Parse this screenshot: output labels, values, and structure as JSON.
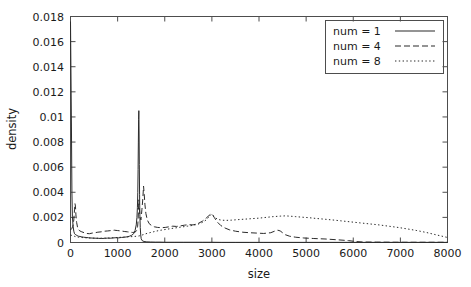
{
  "chart_data": {
    "type": "line",
    "title": "",
    "xlabel": "size",
    "ylabel": "density",
    "xlim": [
      0,
      8000
    ],
    "ylim": [
      0,
      0.018
    ],
    "grid": false,
    "legend_position": "top-right",
    "xticks": [
      0,
      1000,
      2000,
      3000,
      4000,
      5000,
      6000,
      7000,
      8000
    ],
    "xtick_labels": [
      "0",
      "1000",
      "2000",
      "3000",
      "4000",
      "5000",
      "6000",
      "7000",
      "8000"
    ],
    "yticks": [
      0,
      0.002,
      0.004,
      0.006,
      0.008,
      0.01,
      0.012,
      0.014,
      0.016,
      0.018
    ],
    "ytick_labels": [
      "0",
      "0.002",
      "0.004",
      "0.006",
      "0.008",
      "0.01",
      "0.012",
      "0.014",
      "0.016",
      "0.018"
    ],
    "series": [
      {
        "name": "num = 1",
        "label": "num = 1",
        "style": "solid",
        "color": "#2b2b2b",
        "x": [
          0,
          20,
          30,
          40,
          55,
          70,
          85,
          100,
          120,
          140,
          170,
          200,
          240,
          280,
          330,
          380,
          430,
          480,
          540,
          600,
          660,
          720,
          780,
          840,
          900,
          960,
          1020,
          1080,
          1140,
          1200,
          1250,
          1300,
          1340,
          1370,
          1395,
          1410,
          1420,
          1428,
          1434,
          1440,
          1445,
          1450,
          1455,
          1460,
          1466,
          1472,
          1480,
          1490,
          1500,
          1520,
          1560,
          1620,
          1700,
          1800,
          1900,
          2000,
          2200,
          2400,
          2600,
          2800,
          3000,
          3200,
          3500,
          3800,
          4100,
          4400,
          4700,
          5000,
          5500,
          6000,
          6500,
          7000,
          7500,
          8000
        ],
        "y": [
          0.0176,
          0.0092,
          0.004,
          0.0021,
          0.0013,
          0.0009,
          0.0007,
          0.00065,
          0.0006,
          0.00055,
          0.0005,
          0.00048,
          0.00045,
          0.00042,
          0.0004,
          0.00038,
          0.00036,
          0.00035,
          0.00034,
          0.00033,
          0.00032,
          0.00033,
          0.00035,
          0.00034,
          0.00036,
          0.00038,
          0.00037,
          0.0004,
          0.00042,
          0.00045,
          0.0005,
          0.00058,
          0.0007,
          0.00095,
          0.0014,
          0.002,
          0.0028,
          0.004,
          0.0058,
          0.008,
          0.0098,
          0.0105,
          0.0088,
          0.0062,
          0.0038,
          0.0022,
          0.0012,
          0.0006,
          0.0003,
          0.00015,
          8e-05,
          5e-05,
          4e-05,
          3e-05,
          3e-05,
          2e-05,
          2e-05,
          2e-05,
          2e-05,
          2e-05,
          2e-05,
          1e-05,
          1e-05,
          1e-05,
          1e-05,
          1e-05,
          1e-05,
          1e-05,
          1e-05,
          1e-05,
          1e-05,
          1e-05,
          1e-05,
          1e-05
        ],
        "peaks": [
          {
            "x": 0,
            "y": 0.0176
          },
          {
            "x": 1450,
            "y": 0.0105
          }
        ]
      },
      {
        "name": "num = 4",
        "label": "num = 4",
        "style": "dashed",
        "color": "#2b2b2b",
        "x": [
          0,
          25,
          50,
          70,
          85,
          95,
          105,
          115,
          130,
          150,
          175,
          200,
          240,
          290,
          340,
          400,
          460,
          520,
          580,
          650,
          720,
          790,
          860,
          930,
          1000,
          1070,
          1140,
          1210,
          1270,
          1320,
          1360,
          1390,
          1410,
          1425,
          1435,
          1442,
          1450,
          1460,
          1475,
          1495,
          1515,
          1535,
          1550,
          1565,
          1580,
          1600,
          1630,
          1670,
          1720,
          1780,
          1850,
          1930,
          2010,
          2090,
          2170,
          2250,
          2330,
          2420,
          2510,
          2600,
          2700,
          2800,
          2880,
          2940,
          2980,
          3010,
          3050,
          3110,
          3190,
          3280,
          3380,
          3500,
          3650,
          3800,
          3950,
          4100,
          4250,
          4330,
          4400,
          4450,
          4500,
          4560,
          4650,
          4780,
          4950,
          5150,
          5400,
          5650,
          5900,
          6050,
          6200,
          6500,
          7000,
          7500,
          8000
        ],
        "y": [
          0.001,
          0.0011,
          0.0013,
          0.0018,
          0.0026,
          0.0031,
          0.0029,
          0.0022,
          0.0016,
          0.0012,
          0.001,
          0.00092,
          0.00085,
          0.00078,
          0.00072,
          0.0007,
          0.00075,
          0.00078,
          0.00082,
          0.00085,
          0.0009,
          0.00092,
          0.00095,
          0.00098,
          0.00095,
          0.00092,
          0.00088,
          0.00085,
          0.00082,
          0.0008,
          0.00082,
          0.00088,
          0.001,
          0.0013,
          0.0018,
          0.0025,
          0.0034,
          0.0028,
          0.002,
          0.0018,
          0.0026,
          0.0035,
          0.0045,
          0.0038,
          0.003,
          0.0023,
          0.0018,
          0.0015,
          0.00135,
          0.00125,
          0.0012,
          0.00118,
          0.0012,
          0.00125,
          0.0013,
          0.00128,
          0.00132,
          0.00138,
          0.00142,
          0.0014,
          0.0015,
          0.0017,
          0.00195,
          0.00215,
          0.00228,
          0.00225,
          0.002,
          0.00165,
          0.00135,
          0.00115,
          0.001,
          0.0009,
          0.00082,
          0.00078,
          0.00075,
          0.00072,
          0.00078,
          0.0009,
          0.00098,
          0.00092,
          0.00078,
          0.00062,
          0.0005,
          0.00042,
          0.00036,
          0.00032,
          0.00028,
          0.00022,
          0.00015,
          8e-05,
          4e-05,
          3e-05,
          2e-05,
          2e-05,
          2e-05
        ],
        "peaks": [
          {
            "x": 100,
            "y": 0.0031
          },
          {
            "x": 1550,
            "y": 0.0045
          },
          {
            "x": 2980,
            "y": 0.0023
          },
          {
            "x": 4400,
            "y": 0.001
          }
        ]
      },
      {
        "name": "num = 8",
        "label": "num = 8",
        "style": "dotted",
        "color": "#2b2b2b",
        "x": [
          0,
          40,
          80,
          120,
          170,
          230,
          300,
          380,
          460,
          550,
          640,
          730,
          820,
          910,
          1000,
          1090,
          1180,
          1270,
          1350,
          1410,
          1450,
          1490,
          1540,
          1600,
          1680,
          1770,
          1860,
          1950,
          2050,
          2150,
          2260,
          2370,
          2480,
          2590,
          2700,
          2800,
          2880,
          2940,
          2990,
          3050,
          3120,
          3200,
          3300,
          3420,
          3550,
          3700,
          3850,
          4000,
          4150,
          4300,
          4450,
          4550,
          4650,
          4780,
          4900,
          5050,
          5200,
          5380,
          5550,
          5750,
          5950,
          6150,
          6350,
          6550,
          6750,
          6950,
          7150,
          7350,
          7550,
          7750,
          8000
        ],
        "y": [
          0.0006,
          0.00055,
          0.0005,
          0.00045,
          0.00042,
          0.0004,
          0.00038,
          0.00036,
          0.00035,
          0.00034,
          0.00034,
          0.00035,
          0.00036,
          0.00038,
          0.0004,
          0.00042,
          0.00044,
          0.00046,
          0.00048,
          0.0005,
          0.00052,
          0.00056,
          0.00062,
          0.0007,
          0.00078,
          0.00086,
          0.00094,
          0.001,
          0.00106,
          0.00112,
          0.00118,
          0.00124,
          0.0013,
          0.00136,
          0.00145,
          0.0016,
          0.0018,
          0.00205,
          0.00225,
          0.00205,
          0.00185,
          0.00178,
          0.00176,
          0.00178,
          0.00182,
          0.00186,
          0.0019,
          0.00194,
          0.002,
          0.00206,
          0.0021,
          0.00212,
          0.0021,
          0.00206,
          0.00202,
          0.00198,
          0.00192,
          0.00186,
          0.0018,
          0.00172,
          0.00164,
          0.00156,
          0.00148,
          0.0014,
          0.0013,
          0.0012,
          0.00108,
          0.00095,
          0.0008,
          0.00062,
          0.0004
        ],
        "peaks": [
          {
            "x": 2990,
            "y": 0.00225
          },
          {
            "x": 4500,
            "y": 0.00212
          }
        ]
      }
    ]
  }
}
